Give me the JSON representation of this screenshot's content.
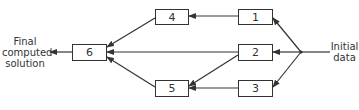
{
  "diagram": {
    "type": "flow",
    "labels": {
      "output": "Final\ncomputed\nsolution",
      "output_lines": [
        "Final",
        "computed",
        "solution"
      ],
      "input_lines": [
        "Initial",
        "data"
      ]
    },
    "nodes": [
      {
        "id": "1",
        "label": "1"
      },
      {
        "id": "2",
        "label": "2"
      },
      {
        "id": "3",
        "label": "3"
      },
      {
        "id": "4",
        "label": "4"
      },
      {
        "id": "5",
        "label": "5"
      },
      {
        "id": "6",
        "label": "6"
      }
    ],
    "edges": [
      {
        "from": "Initial data",
        "to": "1"
      },
      {
        "from": "Initial data",
        "to": "2"
      },
      {
        "from": "Initial data",
        "to": "3"
      },
      {
        "from": "1",
        "to": "4"
      },
      {
        "from": "2",
        "to": "6"
      },
      {
        "from": "2",
        "to": "5"
      },
      {
        "from": "3",
        "to": "5"
      },
      {
        "from": "4",
        "to": "6"
      },
      {
        "from": "5",
        "to": "6"
      },
      {
        "from": "6",
        "to": "Final computed solution"
      }
    ],
    "colors": {
      "stroke": "#333333",
      "background": "#ffffff"
    }
  }
}
